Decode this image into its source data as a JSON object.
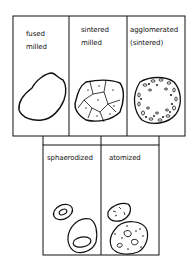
{
  "top_row": [
    {
      "line1": "fused",
      "line2": "milled"
    },
    {
      "line1": "sintered",
      "line2": "milled"
    },
    {
      "line1": "agglomerated",
      "line2": "(sintered)"
    }
  ],
  "bottom_row": [
    {
      "line1": "sphaerodized"
    },
    {
      "line1": "atomized"
    }
  ]
}
